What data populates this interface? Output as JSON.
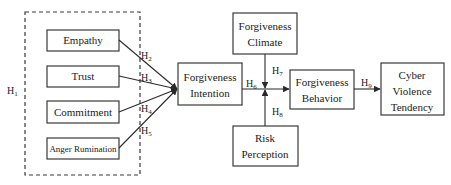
{
  "diagram": {
    "group": {
      "label_main": "H",
      "label_sub": "1",
      "style": "dashed"
    },
    "nodes": {
      "empathy": {
        "lines": [
          "Empathy"
        ]
      },
      "trust": {
        "lines": [
          "Trust"
        ]
      },
      "commitment": {
        "lines": [
          "Commitment"
        ]
      },
      "anger_rumination": {
        "lines": [
          "Anger Rumination"
        ]
      },
      "forgiveness_intention": {
        "lines": [
          "Forgiveness",
          "Intention"
        ]
      },
      "forgiveness_climate": {
        "lines": [
          "Forgiveness",
          "Climate"
        ]
      },
      "risk_perception": {
        "lines": [
          "Risk",
          "Perception"
        ]
      },
      "forgiveness_behavior": {
        "lines": [
          "Forgiveness",
          "Behavior"
        ]
      },
      "cyber_violence_tendency": {
        "lines": [
          "Cyber",
          "Violence",
          "Tendency"
        ]
      }
    },
    "hypotheses": {
      "h2": {
        "main": "H",
        "sub": "2",
        "from": "Empathy",
        "to": "Forgiveness Intention"
      },
      "h3": {
        "main": "H",
        "sub": "3",
        "from": "Trust",
        "to": "Forgiveness Intention"
      },
      "h4": {
        "main": "H",
        "sub": "4",
        "from": "Commitment",
        "to": "Forgiveness Intention"
      },
      "h5": {
        "main": "H",
        "sub": "5",
        "from": "Anger Rumination",
        "to": "Forgiveness Intention"
      },
      "h6": {
        "main": "H",
        "sub": "6",
        "from": "Forgiveness Intention",
        "to": "Forgiveness Behavior"
      },
      "h7": {
        "main": "H",
        "sub": "7",
        "from": "Forgiveness Climate",
        "to": "H6 path (moderation)"
      },
      "h8": {
        "main": "H",
        "sub": "8",
        "from": "Risk Perception",
        "to": "H6 path (moderation)"
      },
      "h9": {
        "main": "H",
        "sub": "9",
        "from": "Forgiveness Behavior",
        "to": "Cyber Violence Tendency"
      }
    },
    "colors": {
      "stroke": "#3a3a3a",
      "text": "#222222",
      "background": "#ffffff"
    }
  }
}
